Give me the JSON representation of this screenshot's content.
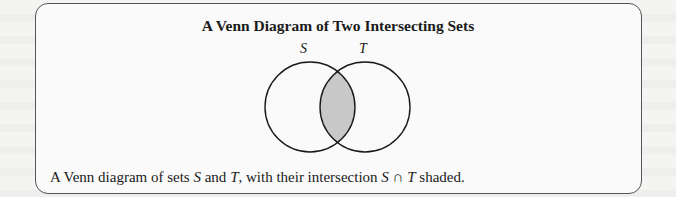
{
  "figure": {
    "title": "A Venn Diagram of Two Intersecting Sets",
    "sets": [
      {
        "label": "S",
        "cx": 310,
        "cy": 107,
        "r": 45
      },
      {
        "label": "T",
        "cx": 365,
        "cy": 107,
        "r": 45
      }
    ],
    "shaded_region": "S ∩ T",
    "colors": {
      "shade": "#c8c8c8",
      "stroke": "#1a1a1a",
      "frame": "#555555"
    },
    "caption": {
      "prefix": "A Venn diagram of sets ",
      "set1": "S",
      "and": " and ",
      "set2": "T",
      "middle": ", with their intersection ",
      "intersection": "S ∩ T",
      "suffix": " shaded."
    }
  }
}
